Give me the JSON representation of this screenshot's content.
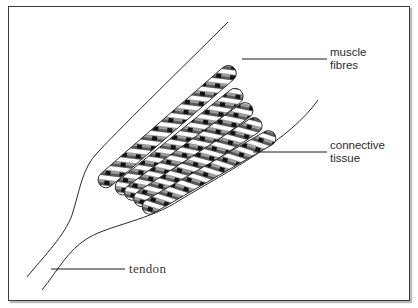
{
  "figure": {
    "labels": {
      "muscle_fibres": {
        "line1": "muscle",
        "line2": "fibres"
      },
      "connective_tissue": {
        "line1": "connective",
        "line2": "tissue"
      },
      "tendon": "tendon"
    },
    "fibre_count": 6,
    "colors": {
      "outline": "#2a2a2a",
      "frame": "#3a3a3a",
      "frame_shadow": "#b9b9b9",
      "fibre_dark": "#1a1a1a",
      "fibre_mid": "#6e6e6e",
      "fibre_light": "#ffffff"
    }
  }
}
